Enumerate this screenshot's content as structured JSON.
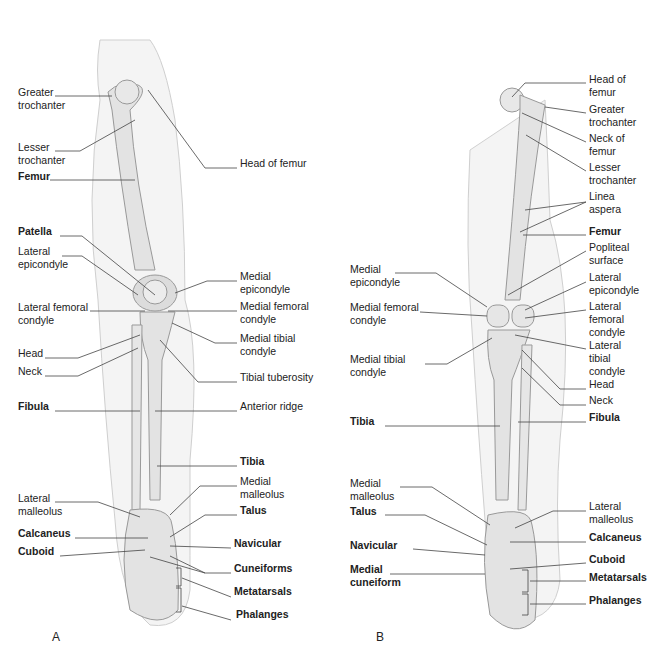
{
  "panels": {
    "A": {
      "letter": "A",
      "labels": [
        {
          "text": "Greater\ntrochanter",
          "bold": false,
          "x": 18,
          "y": 91
        },
        {
          "text": "Lesser\ntrochanter",
          "bold": false,
          "x": 18,
          "y": 146
        },
        {
          "text": "Femur",
          "bold": true,
          "x": 18,
          "y": 175
        },
        {
          "text": "Head of femur",
          "bold": false,
          "x": 240,
          "y": 162
        },
        {
          "text": "Patella",
          "bold": true,
          "x": 18,
          "y": 230
        },
        {
          "text": "Lateral\nepicondyle",
          "bold": false,
          "x": 18,
          "y": 250
        },
        {
          "text": "Lateral femoral\ncondyle",
          "bold": false,
          "x": 18,
          "y": 306
        },
        {
          "text": "Head",
          "bold": false,
          "x": 18,
          "y": 352
        },
        {
          "text": "Neck",
          "bold": false,
          "x": 18,
          "y": 370
        },
        {
          "text": "Fibula",
          "bold": true,
          "x": 18,
          "y": 405
        },
        {
          "text": "Medial\nepicondyle",
          "bold": false,
          "x": 240,
          "y": 275
        },
        {
          "text": "Medial femoral\ncondyle",
          "bold": false,
          "x": 240,
          "y": 305
        },
        {
          "text": "Medial tibial\ncondyle",
          "bold": false,
          "x": 240,
          "y": 337
        },
        {
          "text": "Tibial tuberosity",
          "bold": false,
          "x": 240,
          "y": 376
        },
        {
          "text": "Anterior ridge",
          "bold": false,
          "x": 240,
          "y": 405
        },
        {
          "text": "Tibia",
          "bold": true,
          "x": 240,
          "y": 460
        },
        {
          "text": "Medial\nmalleolus",
          "bold": false,
          "x": 240,
          "y": 480
        },
        {
          "text": "Lateral\nmalleolus",
          "bold": false,
          "x": 18,
          "y": 497
        },
        {
          "text": "Talus",
          "bold": true,
          "x": 240,
          "y": 509
        },
        {
          "text": "Calcaneus",
          "bold": true,
          "x": 18,
          "y": 532
        },
        {
          "text": "Cuboid",
          "bold": true,
          "x": 18,
          "y": 550
        },
        {
          "text": "Navicular",
          "bold": true,
          "x": 234,
          "y": 542
        },
        {
          "text": "Cuneiforms",
          "bold": true,
          "x": 234,
          "y": 567
        },
        {
          "text": "Metatarsals",
          "bold": true,
          "x": 234,
          "y": 590
        },
        {
          "text": "Phalanges",
          "bold": true,
          "x": 236,
          "y": 613
        }
      ]
    },
    "B": {
      "letter": "B",
      "labels": [
        {
          "text": "Head of\nfemur",
          "bold": false,
          "x": 589,
          "y": 78
        },
        {
          "text": "Greater\ntrochanter",
          "bold": false,
          "x": 589,
          "y": 108
        },
        {
          "text": "Neck of\nfemur",
          "bold": false,
          "x": 589,
          "y": 137
        },
        {
          "text": "Lesser\ntrochanter",
          "bold": false,
          "x": 589,
          "y": 166
        },
        {
          "text": "Linea\naspera",
          "bold": false,
          "x": 589,
          "y": 195
        },
        {
          "text": "Femur",
          "bold": true,
          "x": 589,
          "y": 230
        },
        {
          "text": "Popliteal\nsurface",
          "bold": false,
          "x": 589,
          "y": 246
        },
        {
          "text": "Lateral\nepicondyle",
          "bold": false,
          "x": 589,
          "y": 276
        },
        {
          "text": "Lateral\nfemoral\ncondyle",
          "bold": false,
          "x": 589,
          "y": 305
        },
        {
          "text": "Lateral\ntibial\ncondyle",
          "bold": false,
          "x": 589,
          "y": 344
        },
        {
          "text": "Head",
          "bold": false,
          "x": 589,
          "y": 383
        },
        {
          "text": "Neck",
          "bold": false,
          "x": 589,
          "y": 399
        },
        {
          "text": "Fibula",
          "bold": true,
          "x": 589,
          "y": 416
        },
        {
          "text": "Medial\nepicondyle",
          "bold": false,
          "x": 350,
          "y": 268
        },
        {
          "text": "Medial femoral\ncondyle",
          "bold": false,
          "x": 350,
          "y": 306
        },
        {
          "text": "Medial tibial\ncondyle",
          "bold": false,
          "x": 350,
          "y": 358
        },
        {
          "text": "Tibia",
          "bold": true,
          "x": 350,
          "y": 420
        },
        {
          "text": "Medial\nmalleolus",
          "bold": false,
          "x": 350,
          "y": 482
        },
        {
          "text": "Talus",
          "bold": true,
          "x": 350,
          "y": 510
        },
        {
          "text": "Navicular",
          "bold": true,
          "x": 350,
          "y": 544
        },
        {
          "text": "Medial\ncuneiform",
          "bold": true,
          "x": 350,
          "y": 568
        },
        {
          "text": "Lateral\nmalleolus",
          "bold": false,
          "x": 589,
          "y": 505
        },
        {
          "text": "Calcaneus",
          "bold": true,
          "x": 589,
          "y": 536
        },
        {
          "text": "Cuboid",
          "bold": true,
          "x": 589,
          "y": 558
        },
        {
          "text": "Metatarsals",
          "bold": true,
          "x": 589,
          "y": 576
        },
        {
          "text": "Phalanges",
          "bold": true,
          "x": 589,
          "y": 599
        }
      ]
    }
  },
  "colors": {
    "bone": "#e2e2e2",
    "bone_stroke": "#9a9a9a",
    "skin": "#f2f2f2",
    "skin_stroke": "#c8c8c8",
    "leader": "#444444",
    "text": "#222222"
  }
}
